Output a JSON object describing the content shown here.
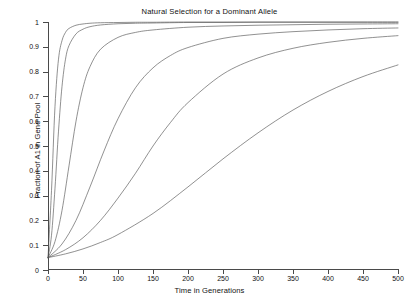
{
  "chart_data": {
    "type": "line",
    "title": "Natural Selection for a Dominant Allele",
    "xlabel": "Time in Generations",
    "ylabel": "Fraction of A1 in Gene Pool",
    "xlim": [
      0,
      500
    ],
    "ylim": [
      0,
      1
    ],
    "xticks": [
      0,
      50,
      100,
      150,
      200,
      250,
      300,
      350,
      400,
      450,
      500
    ],
    "yticks": [
      0,
      0.1,
      0.2,
      0.3,
      0.4,
      0.5,
      0.6,
      0.7,
      0.8,
      0.9,
      1
    ],
    "xtick_labels": [
      "0",
      "50",
      "100",
      "150",
      "200",
      "250",
      "300",
      "350",
      "400",
      "450",
      "500"
    ],
    "ytick_labels": [
      "0",
      "0.1",
      "0.2",
      "0.3",
      "0.4",
      "0.5",
      "0.6",
      "0.7",
      "0.8",
      "0.9",
      "1"
    ],
    "grid": false,
    "legend": "none",
    "line_color": "#555555",
    "initial_frequency": 0.05,
    "series": [
      {
        "name": "s = 0.50",
        "x": [
          0,
          5,
          10,
          15,
          20,
          25,
          30,
          40,
          50,
          60,
          75,
          100,
          125,
          150,
          200,
          250,
          300,
          350,
          400,
          450,
          500
        ],
        "values": [
          0.05,
          0.32,
          0.66,
          0.85,
          0.925,
          0.958,
          0.974,
          0.987,
          0.992,
          0.995,
          0.997,
          0.998,
          0.999,
          0.999,
          1.0,
          1.0,
          1.0,
          1.0,
          1.0,
          1.0,
          1.0
        ]
      },
      {
        "name": "s = 0.25",
        "x": [
          0,
          5,
          10,
          15,
          20,
          25,
          30,
          40,
          50,
          60,
          75,
          100,
          125,
          150,
          200,
          250,
          300,
          350,
          400,
          450,
          500
        ],
        "values": [
          0.05,
          0.14,
          0.33,
          0.56,
          0.74,
          0.85,
          0.905,
          0.952,
          0.971,
          0.981,
          0.988,
          0.993,
          0.995,
          0.996,
          0.998,
          0.998,
          0.999,
          0.999,
          0.999,
          0.999,
          0.999
        ]
      },
      {
        "name": "s = 0.12",
        "x": [
          0,
          10,
          20,
          30,
          40,
          50,
          60,
          75,
          100,
          125,
          150,
          200,
          250,
          300,
          350,
          400,
          450,
          500
        ],
        "values": [
          0.05,
          0.115,
          0.24,
          0.42,
          0.6,
          0.735,
          0.82,
          0.89,
          0.938,
          0.958,
          0.968,
          0.979,
          0.984,
          0.987,
          0.989,
          0.991,
          0.992,
          0.993
        ]
      },
      {
        "name": "s = 0.06",
        "x": [
          0,
          20,
          40,
          60,
          80,
          100,
          125,
          150,
          175,
          200,
          250,
          300,
          350,
          400,
          450,
          500
        ],
        "values": [
          0.05,
          0.105,
          0.2,
          0.335,
          0.48,
          0.61,
          0.735,
          0.815,
          0.865,
          0.897,
          0.934,
          0.951,
          0.961,
          0.968,
          0.973,
          0.976
        ]
      },
      {
        "name": "s = 0.03",
        "x": [
          0,
          25,
          50,
          75,
          100,
          125,
          150,
          175,
          200,
          250,
          300,
          350,
          400,
          450,
          500
        ],
        "values": [
          0.05,
          0.082,
          0.13,
          0.2,
          0.29,
          0.39,
          0.5,
          0.595,
          0.675,
          0.79,
          0.855,
          0.894,
          0.918,
          0.934,
          0.945
        ]
      },
      {
        "name": "s = 0.015",
        "x": [
          0,
          25,
          50,
          75,
          100,
          150,
          200,
          250,
          300,
          350,
          400,
          450,
          500
        ],
        "values": [
          0.05,
          0.065,
          0.085,
          0.111,
          0.143,
          0.228,
          0.335,
          0.448,
          0.553,
          0.645,
          0.72,
          0.78,
          0.827
        ]
      }
    ]
  }
}
